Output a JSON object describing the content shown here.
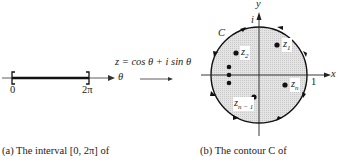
{
  "left_panel": {
    "axis_label": "θ",
    "tick_start": "0",
    "tick_end": "2π",
    "caption": "(a)  The interval [0, 2π]  of"
  },
  "mapping": {
    "formula": "z = cos θ + i sin θ"
  },
  "right_panel": {
    "x_axis_label": "x",
    "y_axis_label": "y",
    "i_label": "i",
    "one_label": "1",
    "contour_label": "C",
    "points": [
      {
        "label": "z1",
        "main": "z",
        "sub": "1"
      },
      {
        "label": "z2",
        "main": "z",
        "sub": "2"
      },
      {
        "label": "zn",
        "main": "z",
        "sub": "n"
      },
      {
        "label": "zn-1",
        "main": "z",
        "sub": "n − 1"
      }
    ],
    "caption": "(b)  The contour C of"
  }
}
